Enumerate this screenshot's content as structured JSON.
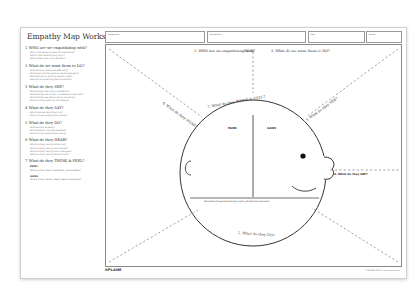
{
  "title": "Empathy Map Worksheet",
  "header_fields": [
    {
      "label": "Designed by"
    },
    {
      "label": "Designed for"
    },
    {
      "label": "Date"
    },
    {
      "label": "Version"
    }
  ],
  "sections": [
    {
      "num": "1",
      "heading": "WHO are we empathizing with?",
      "questions": [
        "Who is the person we want to understand?",
        "What is the situation they are in?",
        "What is their role in the situation?"
      ]
    },
    {
      "num": "2",
      "heading": "What do we want them to DO?",
      "questions": [
        "What do they need to do differently?",
        "What job(s) do they want or need to get done?",
        "What decision(s) do they need to make?",
        "How will we know they were successful?"
      ]
    },
    {
      "num": "3",
      "heading": "What do they SEE?",
      "questions": [
        "What do they see in the marketplace?",
        "What do they see in their immediate environment?",
        "What do they see others saying and doing?",
        "What are they watching and reading?"
      ]
    },
    {
      "num": "4",
      "heading": "What do they SAY?",
      "questions": [
        "What have we heard them say?",
        "What can we imagine them saying?"
      ]
    },
    {
      "num": "5",
      "heading": "What do they DO?",
      "questions": [
        "What do they do today?",
        "What behavior have we observed?",
        "What can we imagine them doing?"
      ]
    },
    {
      "num": "6",
      "heading": "What do they HEAR?",
      "questions": [
        "What are they hearing others say?",
        "What are they hearing from friends?",
        "What are they hearing from colleagues?",
        "What are they hearing second-hand?"
      ]
    },
    {
      "num": "7",
      "heading": "What do they THINK & FEEL?",
      "questions": [],
      "subs": [
        {
          "label": "PAINS",
          "text": "What are their fears, frustrations, and anxieties?"
        },
        {
          "label": "GAINS",
          "text": "What are their wants, needs, hopes and dreams?"
        }
      ]
    }
  ],
  "canvas": {
    "label_who": "1. WHO are we empathizing with?",
    "label_goal": "GOAL",
    "label_do_want": "2. What do we want them to DO?",
    "label_hear": "6. What do they HEAR?",
    "label_see": "3. What do they SEE?",
    "label_think_feel": "7. What do they THINK & FEEL?",
    "label_pains": "PAINS",
    "label_gains": "GAINS",
    "label_say": "4. What do they SAY?",
    "label_behavior_q": "What other thoughts & feelings might motivate their behavior?",
    "label_do": "5. What do they DO?"
  },
  "footer": {
    "logo": "XPLANE",
    "copyright": "©XPLANE 2017 | www.xplane.com"
  },
  "colors": {
    "border": "#888888",
    "text": "#333333",
    "dashed": "#999999"
  }
}
